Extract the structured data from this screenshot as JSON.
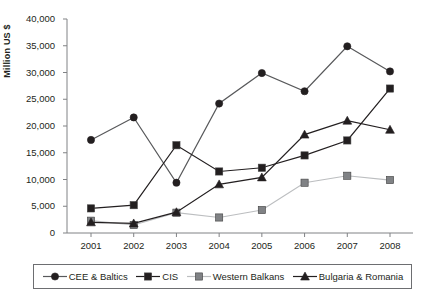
{
  "chart_data": {
    "type": "line",
    "title": "",
    "subtitle": "",
    "xlabel": "",
    "ylabel": "Million US $",
    "categories": [
      "2001",
      "2002",
      "2003",
      "2004",
      "2005",
      "2006",
      "2007",
      "2008"
    ],
    "x": [
      2001,
      2002,
      2003,
      2004,
      2005,
      2006,
      2007,
      2008
    ],
    "ylim": [
      0,
      40000
    ],
    "yticks": [
      0,
      5000,
      10000,
      15000,
      20000,
      25000,
      30000,
      35000,
      40000
    ],
    "ytick_labels": [
      "0",
      "5,000",
      "10,000",
      "15,000",
      "20,000",
      "25,000",
      "30,000",
      "35,000",
      "40,000"
    ],
    "grid": false,
    "legend_position": "bottom",
    "series": [
      {
        "name": "CEE & Baltics",
        "marker": "circle",
        "color": "#231f20",
        "line_color": "#58595b",
        "values": [
          17400,
          21600,
          9400,
          24200,
          29900,
          26500,
          34900,
          30200
        ]
      },
      {
        "name": "CIS",
        "marker": "square",
        "color": "#231f20",
        "line_color": "#231f20",
        "values": [
          4600,
          5200,
          16400,
          11500,
          12200,
          14500,
          17300,
          27000
        ]
      },
      {
        "name": "Western Balkans",
        "marker": "square",
        "color": "#808285",
        "line_color": "#bcbec0",
        "values": [
          2300,
          1500,
          3800,
          2900,
          4300,
          9400,
          10700,
          9900
        ]
      },
      {
        "name": "Bulgaria & Romania",
        "marker": "triangle",
        "color": "#231f20",
        "line_color": "#231f20",
        "values": [
          2000,
          1800,
          3900,
          9100,
          10400,
          18400,
          21000,
          19300
        ]
      }
    ]
  },
  "axis": {
    "line_color": "#808285",
    "tick_color": "#808285"
  },
  "legend": {
    "items": [
      {
        "label": "CEE & Baltics",
        "marker": "circle-marker-icon"
      },
      {
        "label": "CIS",
        "marker": "square-marker-icon"
      },
      {
        "label": "Western Balkans",
        "marker": "gray-square-marker-icon"
      },
      {
        "label": "Bulgaria & Romania",
        "marker": "triangle-marker-icon"
      }
    ]
  }
}
